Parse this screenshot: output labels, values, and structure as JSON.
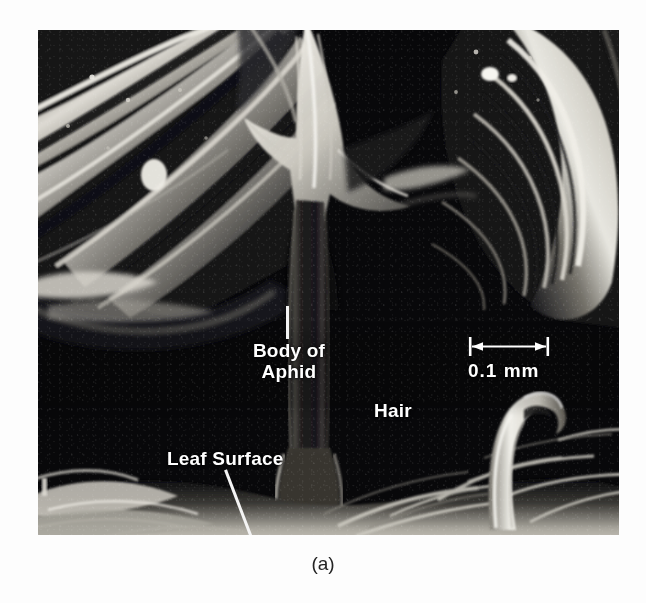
{
  "figure": {
    "caption": "(a)",
    "background_color": "#fdfdfd",
    "photo": {
      "type": "scanning-electron-micrograph",
      "subject": "Aphid bodies straddling a leaf hair on a leaf surface",
      "background_color": "#07070a",
      "highlight_color": "#f2f0ea"
    }
  },
  "annotations": {
    "body_of_aphid": {
      "label": "Body of\nAphid",
      "color": "#ffffff"
    },
    "hair": {
      "label": "Hair",
      "color": "#ffffff"
    },
    "leaf_surface": {
      "label": "Leaf Surface",
      "color": "#ffffff"
    }
  },
  "scale_bar": {
    "value": "0.1 mm",
    "length_px": 82,
    "color": "#ffffff",
    "style": "double-headed-arrow-with-end-ticks"
  }
}
